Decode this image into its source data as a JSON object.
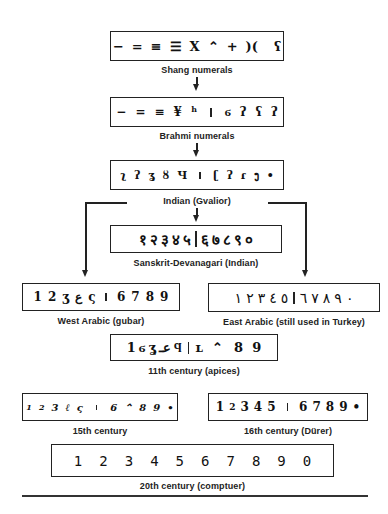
{
  "diagram": {
    "stages": [
      {
        "id": "shang",
        "label": "Shang numerals",
        "left": [
          "−",
          "=",
          "≡",
          "☰",
          "X",
          "⌃",
          "+",
          ")(",
          "ʕ"
        ],
        "right": []
      },
      {
        "id": "brahmi",
        "label": "Brahmi numerals",
        "left": [
          "−",
          "=",
          "≡",
          "¥",
          "ʰ"
        ],
        "right": [
          "ϭ",
          "ʔ",
          "ʕ",
          "ʔ"
        ]
      },
      {
        "id": "gvalior",
        "label": "Indian (Gvalior)",
        "left": [
          "ʅ",
          "ʔ",
          "ʓ",
          "ȣ",
          "Ч"
        ],
        "right": [
          "ʗ",
          "ʔ",
          "ɾ",
          "ງ",
          "•"
        ]
      },
      {
        "id": "sanskrit",
        "label": "Sanskrit-Devanagari (Indian)",
        "left": [
          "१",
          "२",
          "३",
          "४",
          "५"
        ],
        "right": [
          "६",
          "७",
          "८",
          "९",
          "०"
        ]
      },
      {
        "id": "west-arabic",
        "label": "West Arabic (gubar)",
        "left": [
          "1",
          "2",
          "ʒ",
          "ع",
          "ς"
        ],
        "right": [
          "6",
          "7",
          "8",
          "9"
        ]
      },
      {
        "id": "east-arabic",
        "label": "East Arabic (still used in Turkey)",
        "left": [
          "١",
          "٢",
          "٣",
          "٤",
          "٥"
        ],
        "right": [
          "٦",
          "٧",
          "٨",
          "٩",
          "٠"
        ]
      },
      {
        "id": "apices",
        "label": "11th century (apices)",
        "left": [
          "1",
          "ϭ",
          "ʓ",
          "عـ",
          "ϥ"
        ],
        "right": [
          "ʟ",
          "⌃",
          "8",
          "9"
        ]
      },
      {
        "id": "15th",
        "label": "15th century",
        "left": [
          "1",
          "2",
          "3",
          "ℓ",
          "ς"
        ],
        "right": [
          "6",
          "⌃",
          "8",
          "9",
          "•"
        ]
      },
      {
        "id": "16th",
        "label": "16th century (Dürer)",
        "left": [
          "1",
          "2",
          "3",
          "4",
          "5"
        ],
        "right": [
          "6",
          "7",
          "8",
          "9",
          "•"
        ]
      },
      {
        "id": "20th",
        "label": "20th century (comptuer)",
        "left": [
          "1",
          "2",
          "3",
          "4",
          "5",
          "6",
          "7",
          "8",
          "9",
          "0"
        ],
        "right": []
      }
    ]
  }
}
